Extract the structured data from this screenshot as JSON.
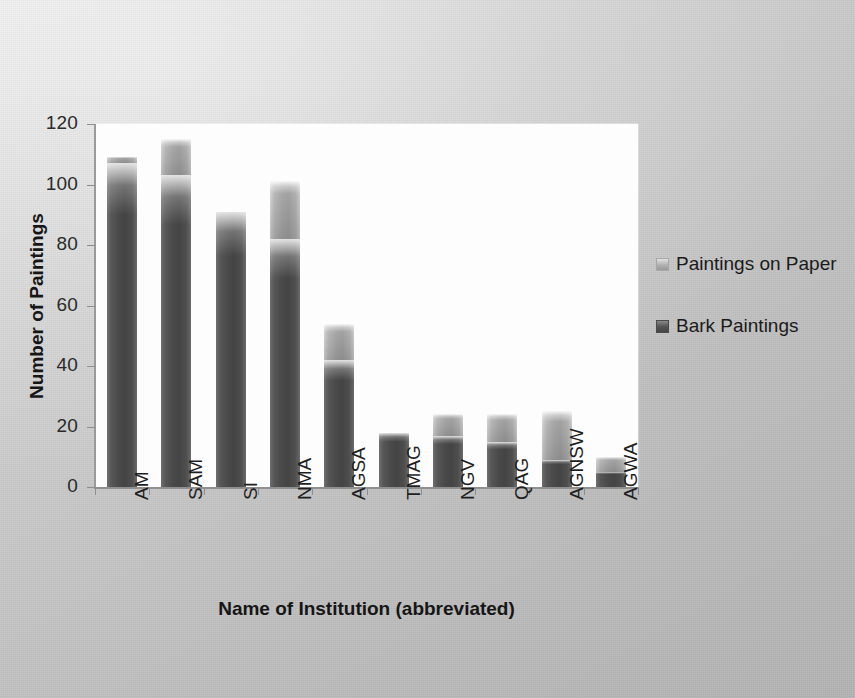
{
  "chart_data": {
    "type": "bar",
    "subtype": "stacked-column",
    "title": "",
    "xlabel": "Name of Institution (abbreviated)",
    "ylabel": "Number of Paintings",
    "categories": [
      "AM",
      "SAM",
      "SI",
      "NMA",
      "AGSA",
      "TMAG",
      "NGV",
      "QAG",
      "AGNSW",
      "AGWA"
    ],
    "series": [
      {
        "name": "Bark Paintings",
        "color": "#4a4a4a",
        "values": [
          107,
          103,
          91,
          82,
          42,
          18,
          17,
          15,
          9,
          5
        ]
      },
      {
        "name": "Paintings on Paper",
        "color": "#a2a2a2",
        "values": [
          2,
          12,
          0,
          19,
          12,
          0,
          7,
          9,
          16,
          5
        ]
      }
    ],
    "totals": [
      109,
      115,
      91,
      101,
      54,
      18,
      24,
      24,
      25,
      10
    ],
    "ylim": [
      0,
      120
    ],
    "yticks": [
      0,
      20,
      40,
      60,
      80,
      100,
      120
    ],
    "ytick_labels": [
      "0",
      "20",
      "40",
      "60",
      "80",
      "100",
      "120"
    ],
    "grid": false,
    "legend_position": "right",
    "legend_entries": [
      "Paintings on Paper",
      "Bark Paintings"
    ],
    "plot_background": "#fdfdfd",
    "figure_background": "#c9c9c9"
  },
  "axes": {
    "y_title": "Number of Paintings",
    "x_title": "Name of Institution (abbreviated)"
  },
  "legend": {
    "items": [
      {
        "label": "Paintings on Paper",
        "swatch": "paper"
      },
      {
        "label": "Bark Paintings",
        "swatch": "bark"
      }
    ]
  }
}
